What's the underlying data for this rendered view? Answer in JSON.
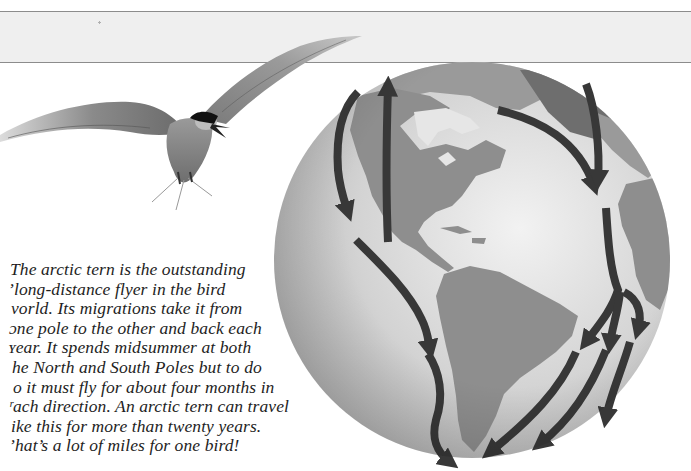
{
  "page": {
    "header_band": {
      "fill": "#efefef",
      "rule_color": "#8c8c8c"
    },
    "body_text": {
      "lines": [
        "The arctic tern is the outstanding",
        "long-distance flyer in the bird",
        "world. Its migrations take it from",
        "one pole to the other and back each",
        "year. It spends midsummer at both",
        "the North and South Poles but to do",
        "so it must fly for about four months in",
        "each direction. An arctic tern can travel",
        "like this for more than twenty years.",
        "That’s a lot of miles for one bird!"
      ],
      "visible_lines": [
        "The arctic tern is the outstanding",
        "’long-distance flyer in the bird",
        "vorld. Its migrations take it from",
        "ɔne pole to the other and back each",
        "ʏear. It spends midsummer at both",
        "he North and South Poles but to do",
        "o it must fly for about four months in",
        "ʳach direction. An arctic tern can travel",
        "ike this for more than twenty years.",
        "ʼhat’s a lot of miles for one bird!"
      ]
    },
    "illustrations": {
      "bird": {
        "subject": "arctic tern in flight",
        "cap_color": "#111111"
      },
      "globe": {
        "subject": "globe showing the Americas with arctic tern migration routes",
        "ocean_color": "#d6d6d6",
        "land_color": "#8e8e8e",
        "ice_color": "#b4b4b4",
        "arrow_color": "#383838"
      }
    }
  }
}
